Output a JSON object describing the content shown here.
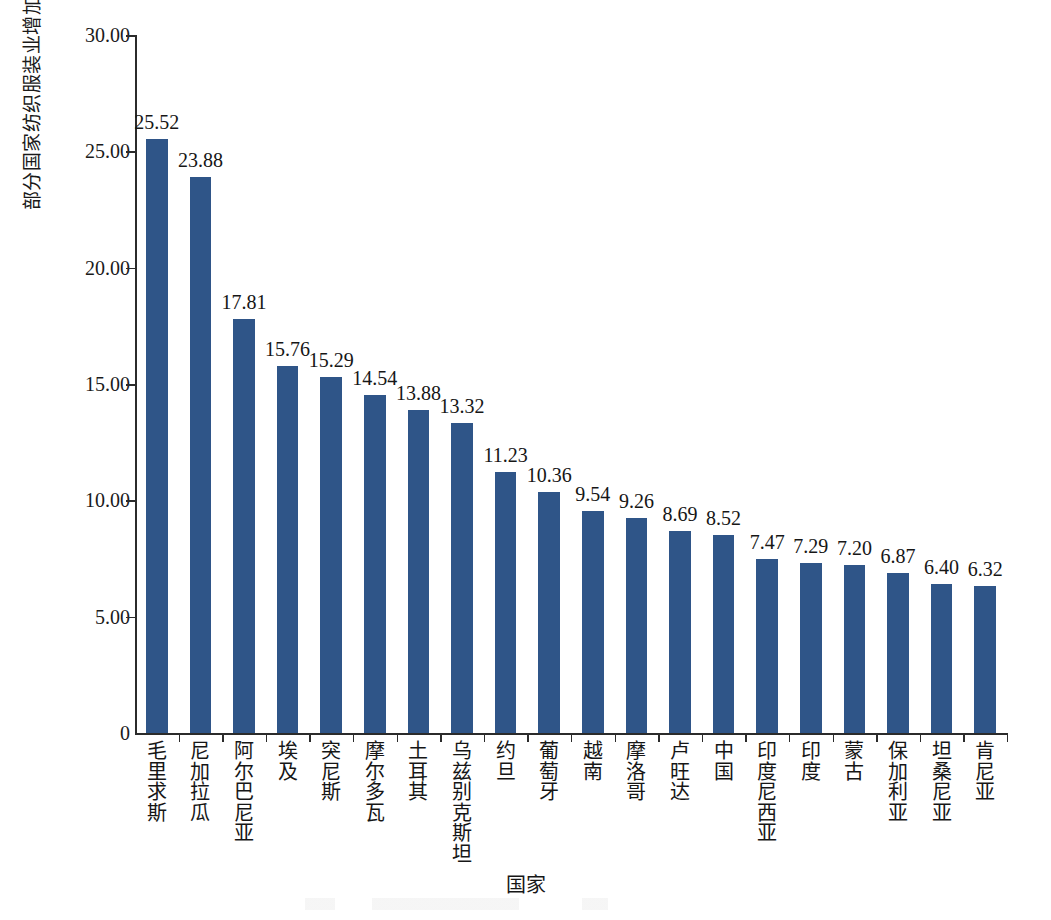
{
  "chart_data": {
    "type": "bar",
    "title": "",
    "xlabel": "国家",
    "ylabel": "部分国家纺织服装业增加值占制造业的比重/%",
    "ylim": [
      0,
      30
    ],
    "ytick_labels": [
      "30.00",
      "25.00",
      "20.00",
      "15.00",
      "10.00",
      "5.00",
      "0"
    ],
    "ytick_values": [
      30,
      25,
      20,
      15,
      10,
      5,
      0
    ],
    "grid": false,
    "legend": "none",
    "bar_color": "#2f5588",
    "axis_color": "#2b2b2b",
    "categories": [
      "毛里求斯",
      "尼加拉瓜",
      "阿尔巴尼亚",
      "埃及",
      "突尼斯",
      "摩尔多瓦",
      "土耳其",
      "乌兹别克斯坦",
      "约旦",
      "葡萄牙",
      "越南",
      "摩洛哥",
      "卢旺达",
      "中国",
      "印度尼西亚",
      "印度",
      "蒙古",
      "保加利亚",
      "坦桑尼亚",
      "肯尼亚"
    ],
    "values": [
      25.52,
      23.88,
      17.81,
      15.76,
      15.29,
      14.54,
      13.88,
      13.32,
      11.23,
      10.36,
      9.54,
      9.26,
      8.69,
      8.52,
      7.47,
      7.29,
      7.2,
      6.87,
      6.4,
      6.32
    ],
    "value_labels": [
      "25.52",
      "23.88",
      "17.81",
      "15.76",
      "15.29",
      "14.54",
      "13.88",
      "13.32",
      "11.23",
      "10.36",
      "9.54",
      "9.26",
      "8.69",
      "8.52",
      "7.47",
      "7.29",
      "7.20",
      "6.87",
      "6.40",
      "6.32"
    ]
  }
}
